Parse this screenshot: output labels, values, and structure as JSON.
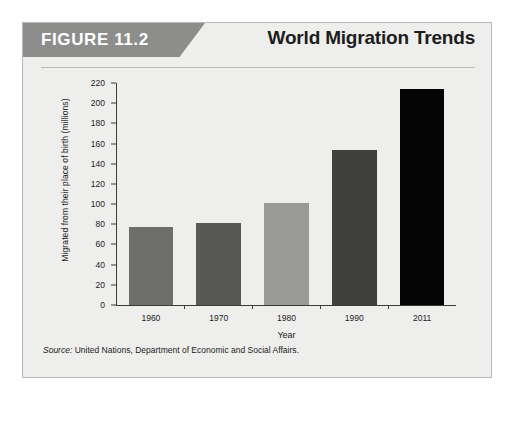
{
  "figure": {
    "tag": "FIGURE 11.2",
    "title": "World Migration Trends",
    "source_label": "Source:",
    "source_text": " United Nations, Department of Economic and Social Affairs."
  },
  "chart_data": {
    "type": "bar",
    "title": "World Migration Trends",
    "categories": [
      "1960",
      "1970",
      "1980",
      "1990",
      "2011"
    ],
    "values": [
      77,
      81,
      101,
      154,
      214
    ],
    "xlabel": "Year",
    "ylabel": "Migrated from their place of birth (millions)",
    "ylim": [
      0,
      220
    ],
    "ytick_step": 20,
    "yticks": [
      "220",
      "200",
      "180",
      "160",
      "140",
      "120",
      "100",
      "80",
      "60",
      "40",
      "20",
      "0"
    ],
    "grid": false,
    "legend": "none",
    "bar_colors": [
      "#6e6e6c",
      "#585856",
      "#9a9a98",
      "#3f3f3d",
      "#050505"
    ]
  }
}
